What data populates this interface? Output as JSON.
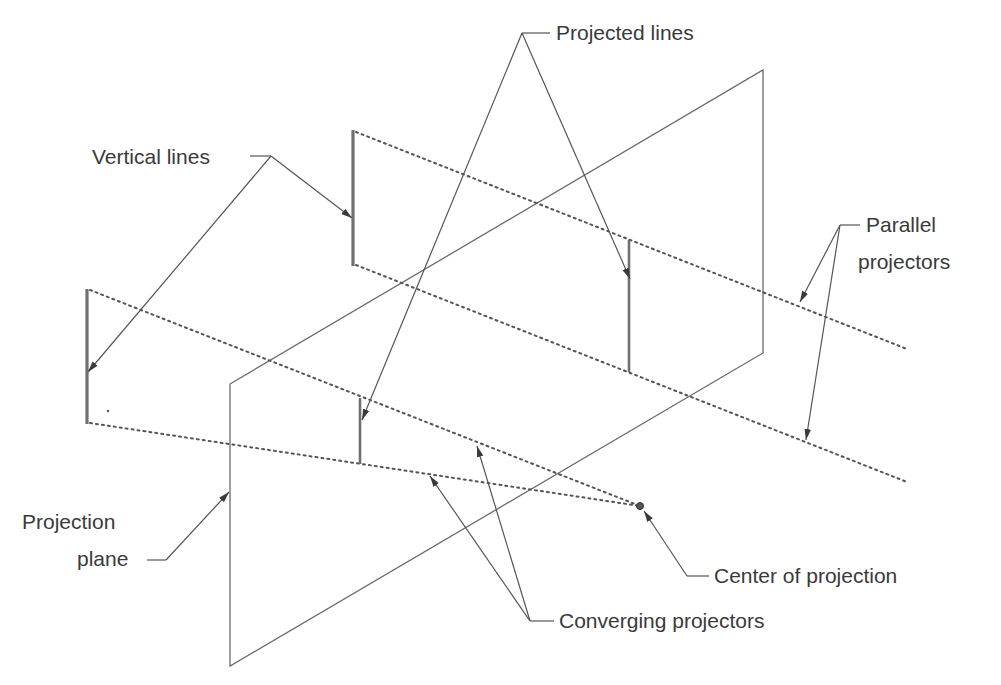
{
  "diagram": {
    "type": "perspective-vs-parallel-projection",
    "labels": {
      "projected_lines": "Projected lines",
      "vertical_lines": "Vertical lines",
      "parallel_projectors_1": "Parallel",
      "parallel_projectors_2": "projectors",
      "projection_plane_1": "Projection",
      "projection_plane_2": "plane",
      "center_of_projection": "Center of projection",
      "converging_projectors": "Converging projectors"
    },
    "colors": {
      "line": "#6b6b6b",
      "text": "#3a3a3a",
      "background": "#ffffff"
    }
  }
}
